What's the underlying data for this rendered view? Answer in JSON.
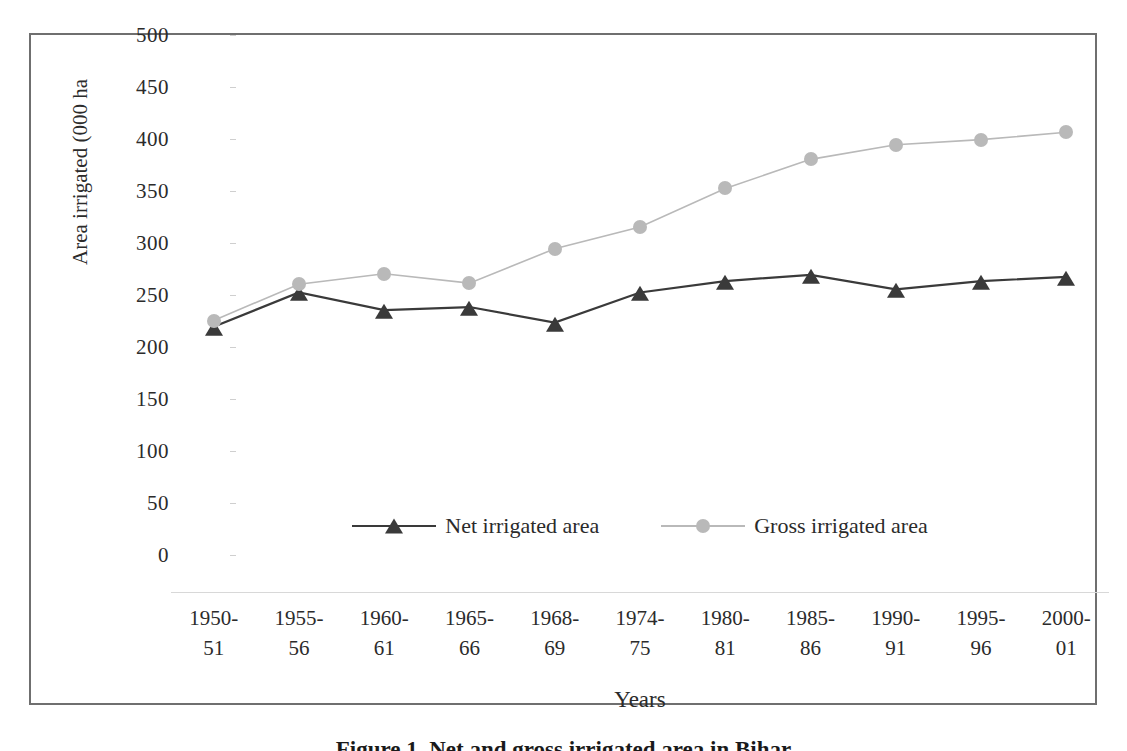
{
  "figure": {
    "caption": "Figure 1. Net and gross irrigated area in Bihar",
    "border_color": "#6f6f6f"
  },
  "chart_data": {
    "type": "line",
    "title": "",
    "xlabel": "Years",
    "ylabel": "Area irrigated (000 ha",
    "ylim": [
      0,
      500
    ],
    "yticks": [
      500,
      450,
      400,
      350,
      300,
      250,
      200,
      150,
      100,
      50,
      0
    ],
    "ytick_labels": [
      "500",
      "450",
      "400",
      "350",
      "300",
      "250",
      "200",
      "150",
      "100",
      "50",
      "0"
    ],
    "grid": false,
    "legend_position": "inside-bottom-center",
    "categories": [
      "1950-\n51",
      "1955-\n56",
      "1960-\n61",
      "1965-\n66",
      "1968-\n69",
      "1974-\n75",
      "1980-\n81",
      "1985-\n86",
      "1990-\n91",
      "1995-\n96",
      "2000-\n01"
    ],
    "category_lines": [
      [
        "1950-",
        "51"
      ],
      [
        "1955-",
        "56"
      ],
      [
        "1960-",
        "61"
      ],
      [
        "1965-",
        "66"
      ],
      [
        "1968-",
        "69"
      ],
      [
        "1974-",
        "75"
      ],
      [
        "1980-",
        "81"
      ],
      [
        "1985-",
        "86"
      ],
      [
        "1990-",
        "91"
      ],
      [
        "1995-",
        "96"
      ],
      [
        "2000-",
        "01"
      ]
    ],
    "series": [
      {
        "name": "Net irrigated area",
        "marker": "triangle",
        "color": "#3a3a3a",
        "values": [
          255,
          288,
          271,
          274,
          259,
          288,
          299,
          305,
          291,
          299,
          303
        ]
      },
      {
        "name": "Gross irrigated area",
        "marker": "circle",
        "color": "#b9b9b9",
        "values": [
          261,
          296,
          306,
          297,
          330,
          351,
          388,
          416,
          430,
          435,
          442
        ]
      }
    ]
  },
  "legend": {
    "items": [
      {
        "label": "Net irrigated area",
        "marker": "triangle-marker",
        "color": "#3a3a3a"
      },
      {
        "label": "Gross irrigated area",
        "marker": "circle-marker",
        "color": "#b9b9b9"
      }
    ]
  }
}
